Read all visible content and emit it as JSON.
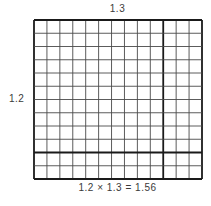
{
  "diagram": {
    "top_label": "1.3",
    "left_label": "1.2",
    "equation": "1.2 × 1.3 = 1.56",
    "grid": {
      "columns": 13,
      "rows": 12,
      "whole_columns": 10,
      "whole_rows": 10,
      "tenth_columns": 3,
      "tenth_rows": 2,
      "left": 34,
      "top": 20,
      "right": 202,
      "bottom": 179,
      "thin_line_color": "#4a4a4a",
      "thick_line_color": "#1a1a1a"
    }
  }
}
